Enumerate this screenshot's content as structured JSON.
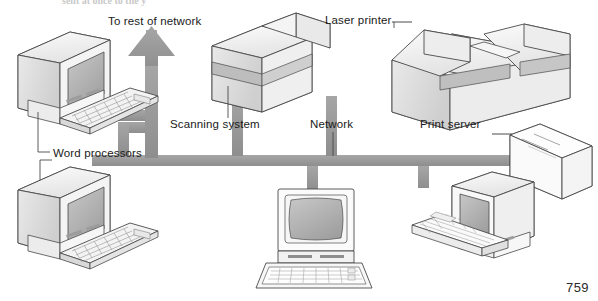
{
  "figure": {
    "page_number": "759",
    "cropped_caption_fragment": "sent at    once    to    the      y"
  },
  "labels": {
    "to_rest_of_network": "To rest of network",
    "laser_printer": "Laser printer",
    "scanning_system": "Scanning system",
    "network": "Network",
    "print_server": "Print server",
    "word_processors": "Word processors"
  },
  "nodes": [
    {
      "id": "word-processor-top",
      "label": "Word processors",
      "kind": "workstation",
      "view": "isometric-left"
    },
    {
      "id": "word-processor-bottom",
      "label": "Word processors",
      "kind": "workstation",
      "view": "isometric-left"
    },
    {
      "id": "scanning-system",
      "label": "Scanning system",
      "kind": "scanner",
      "view": "isometric"
    },
    {
      "id": "laser-printer",
      "label": "Laser printer",
      "kind": "printer",
      "view": "isometric"
    },
    {
      "id": "print-server",
      "label": "Print server",
      "kind": "server",
      "view": "isometric"
    },
    {
      "id": "workstation-center",
      "label": "",
      "kind": "workstation",
      "view": "front"
    },
    {
      "id": "workstation-right",
      "label": "",
      "kind": "workstation",
      "view": "isometric-left"
    }
  ],
  "bus": {
    "label": "Network",
    "uplink_label": "To rest of network",
    "uplink_direction": "up"
  },
  "colors": {
    "bus_gray": "#9a9a9a",
    "bus_gray_dark": "#8a8a8a",
    "outline": "#4a4a4a",
    "face_light": "#f2f2f2",
    "face_mid": "#dcdcdc",
    "face_dark": "#b9b9b9",
    "screen_gray": "#b0b0b0",
    "paper_white": "#ffffff",
    "text": "#1a1a1a"
  }
}
